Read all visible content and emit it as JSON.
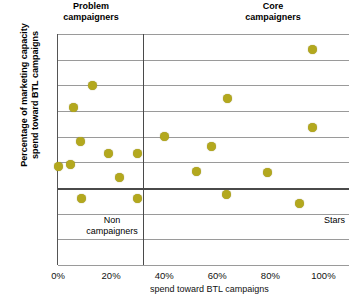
{
  "chart_data": {
    "type": "scatter",
    "title": "",
    "xlabel": "Percentage of marketing spend toward BTL campaigns",
    "ylabel": "Percentage of marketing capacity\nspend toward BTL campaigns",
    "xlim": [
      0,
      110
    ],
    "ylim": [
      0,
      90
    ],
    "grid": true,
    "legend": "none",
    "x_ticks": [
      "0%",
      "20%",
      "40%",
      "60%",
      "80%",
      "100%"
    ],
    "x_tick_values": [
      0,
      20,
      40,
      60,
      80,
      100
    ],
    "y_ticks": [
      "0%",
      "10%",
      "20%",
      "30%",
      "40%",
      "50%",
      "60%",
      "70%",
      "80%",
      "90%"
    ],
    "y_tick_values": [
      0,
      10,
      20,
      30,
      40,
      50,
      60,
      70,
      80,
      90
    ],
    "point_color": "#b3a81e",
    "quadrant_divider_x": 32,
    "quadrant_divider_y": 30,
    "annotations": [
      {
        "name": "problem-campaigners",
        "text": "Problem\ncampaigners",
        "position": "top-left"
      },
      {
        "name": "core-campaigners",
        "text": "Core\ncampaigners",
        "position": "top-right"
      },
      {
        "name": "non-campaigners",
        "text": "Non\ncampaigners",
        "position": "bottom-left"
      },
      {
        "name": "stars",
        "text": "Stars",
        "position": "bottom-right"
      }
    ],
    "points": [
      {
        "x": 0,
        "y": 38.5
      },
      {
        "x": 4.8,
        "y": 39.0
      },
      {
        "x": 6.0,
        "y": 61.5
      },
      {
        "x": 8.5,
        "y": 48.0
      },
      {
        "x": 9.0,
        "y": 26.0
      },
      {
        "x": 13.0,
        "y": 70.0
      },
      {
        "x": 19.0,
        "y": 43.5
      },
      {
        "x": 23.0,
        "y": 34.0
      },
      {
        "x": 30.0,
        "y": 43.5
      },
      {
        "x": 30.0,
        "y": 26.0
      },
      {
        "x": 40.0,
        "y": 50.0
      },
      {
        "x": 52.0,
        "y": 36.5
      },
      {
        "x": 58.0,
        "y": 46.0
      },
      {
        "x": 63.5,
        "y": 27.5
      },
      {
        "x": 64.0,
        "y": 65.0
      },
      {
        "x": 79.0,
        "y": 36.0
      },
      {
        "x": 91.0,
        "y": 24.0
      },
      {
        "x": 96.0,
        "y": 53.5
      },
      {
        "x": 96.0,
        "y": 84.0
      }
    ]
  },
  "labels": {
    "problem_campaigners": "Problem\ncampaigners",
    "core_campaigners": "Core\ncampaigners",
    "non_campaigners": "Non\ncampaigners",
    "stars": "Stars",
    "y_axis_title": "Percentage of marketing capacity\nspend toward BTL campaigns",
    "x_axis_caption": "spend toward BTL campaigns"
  }
}
